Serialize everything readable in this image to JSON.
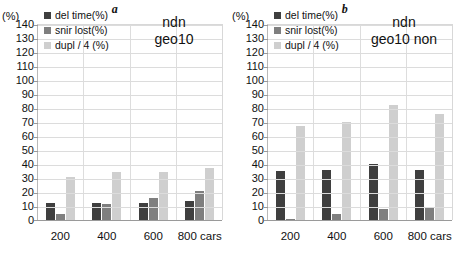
{
  "figure": {
    "panels": [
      {
        "title": "a",
        "axis_unit": "(%)",
        "annotation_line1": "ndn",
        "annotation_line2": "geo10"
      },
      {
        "title": "b",
        "axis_unit": "(%)",
        "annotation_line1": "ndn",
        "annotation_line2": "geo10 non"
      }
    ],
    "legend": [
      {
        "label": "del time(%)",
        "color": "#3f3f3f"
      },
      {
        "label": "snir lost(%)",
        "color": "#7f7f7f"
      },
      {
        "label": "dupl / 4 (%)",
        "color": "#cfcfcf"
      }
    ],
    "yticks": [
      140,
      130,
      120,
      110,
      100,
      90,
      80,
      70,
      60,
      50,
      40,
      30,
      20,
      10,
      0
    ]
  },
  "chart_data": [
    {
      "type": "bar",
      "title": "a",
      "subtitle": "ndn geo10",
      "xlabel": "",
      "ylabel": "(%)",
      "ylim": [
        0,
        140
      ],
      "ytick_step": 10,
      "grid": true,
      "legend_position": "top-left",
      "categories": [
        "200",
        "400",
        "600",
        "800 cars"
      ],
      "series": [
        {
          "name": "del time(%)",
          "color": "#3f3f3f",
          "values": [
            12,
            12.5,
            12.5,
            13.5
          ]
        },
        {
          "name": "snir lost(%)",
          "color": "#7f7f7f",
          "values": [
            4,
            11.5,
            16,
            21
          ]
        },
        {
          "name": "dupl / 4 (%)",
          "color": "#cfcfcf",
          "values": [
            31,
            34,
            34.5,
            37
          ]
        }
      ]
    },
    {
      "type": "bar",
      "title": "b",
      "subtitle": "ndn geo10 non",
      "xlabel": "",
      "ylabel": "(%)",
      "ylim": [
        0,
        140
      ],
      "ytick_step": 10,
      "grid": true,
      "legend_position": "top-left",
      "categories": [
        "200",
        "400",
        "600",
        "800 cars"
      ],
      "series": [
        {
          "name": "del time(%)",
          "color": "#3f3f3f",
          "values": [
            35,
            35.5,
            40,
            35.5
          ]
        },
        {
          "name": "snir lost(%)",
          "color": "#7f7f7f",
          "values": [
            1,
            4.5,
            8,
            9
          ]
        },
        {
          "name": "dupl / 4 (%)",
          "color": "#cfcfcf",
          "values": [
            67,
            70,
            82,
            76
          ]
        }
      ]
    }
  ]
}
